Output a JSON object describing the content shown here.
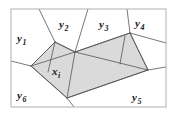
{
  "figure": {
    "type": "voronoi-natural-neighbor-diagram",
    "background": "#ffffff",
    "frame": {
      "color": "#b0b0b0",
      "x": 11,
      "y": 9,
      "width": 155,
      "height": 98
    },
    "style": {
      "cell_edge_color": "#555555",
      "cell_edge_width": 0.8,
      "shaded_fill": "#d4d4d4",
      "shaded_fill_opacity": 0.85,
      "shaded_edge_color": "#4a4a4a",
      "label_color": "#1a1a1a"
    },
    "labels": [
      {
        "name": "label-y1",
        "base": "y",
        "sub": "1",
        "x": 17,
        "y": 29
      },
      {
        "name": "label-y2",
        "base": "y",
        "sub": "2",
        "x": 59,
        "y": 15
      },
      {
        "name": "label-y3",
        "base": "y",
        "sub": "3",
        "x": 99,
        "y": 15
      },
      {
        "name": "label-y4",
        "base": "y",
        "sub": "4",
        "x": 135,
        "y": 14
      },
      {
        "name": "label-y5",
        "base": "y",
        "sub": "5",
        "x": 132,
        "y": 88
      },
      {
        "name": "label-y6",
        "base": "y",
        "sub": "6",
        "x": 17,
        "y": 86
      },
      {
        "name": "label-xi",
        "base": "x",
        "sub": "i",
        "x": 52,
        "y": 62
      }
    ],
    "shaded_polygon": {
      "name": "natural-neighbor-cell-of-xi",
      "points": "31,66 55,42 75,52 130,33 148,70 67,98"
    },
    "voronoi_edges": [
      {
        "name": "edge-y1-y2",
        "points": "55,42 39,9"
      },
      {
        "name": "edge-y2-y3",
        "points": "75,52 88,9"
      },
      {
        "name": "edge-y3-y4",
        "points": "130,33 127,9"
      },
      {
        "name": "edge-y4-right",
        "points": "130,33 166,43"
      },
      {
        "name": "edge-y1-y6",
        "points": "31,66 11,61"
      },
      {
        "name": "edge-y5-right",
        "points": "148,70 166,67"
      },
      {
        "name": "edge-y6-y5",
        "points": "67,98 74,107"
      },
      {
        "name": "edge-xi-upper-left",
        "points": "31,66 55,42"
      },
      {
        "name": "edge-xi-upper-mid",
        "points": "55,42 75,52"
      },
      {
        "name": "edge-xi-upper-right",
        "points": "75,52 130,33"
      },
      {
        "name": "edge-xi-right",
        "points": "130,33 148,70"
      },
      {
        "name": "edge-xi-lower-right",
        "points": "148,70 67,98"
      },
      {
        "name": "edge-xi-lower-left",
        "points": "67,98 31,66"
      },
      {
        "name": "chord-a",
        "points": "55,42 48,72"
      },
      {
        "name": "chord-b",
        "points": "31,66 75,52"
      },
      {
        "name": "chord-c",
        "points": "75,52 67,98"
      },
      {
        "name": "chord-d",
        "points": "75,52 148,70"
      },
      {
        "name": "chord-e",
        "points": "125,36 120,64"
      }
    ]
  }
}
